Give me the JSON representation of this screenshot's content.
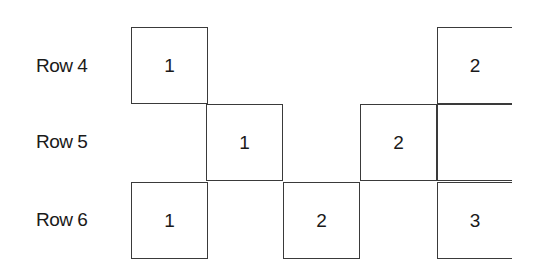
{
  "diagram": {
    "rows": [
      {
        "label": "Row 4",
        "top": 27,
        "label_top": 55
      },
      {
        "label": "Row 5",
        "top": 104,
        "label_top": 131
      },
      {
        "label": "Row 6",
        "top": 182,
        "label_top": 209
      }
    ],
    "columns_x": [
      131,
      206,
      283,
      360,
      437
    ],
    "cell_size": 77,
    "cells": [
      {
        "row": 0,
        "col": 0,
        "value": "1",
        "open_right": false
      },
      {
        "row": 0,
        "col": 4,
        "value": "2",
        "open_right": true
      },
      {
        "row": 1,
        "col": 1,
        "value": "1",
        "open_right": false
      },
      {
        "row": 1,
        "col": 3,
        "value": "2",
        "open_right": false
      },
      {
        "row": 1,
        "col": 4,
        "value": "",
        "open_right": true
      },
      {
        "row": 2,
        "col": 0,
        "value": "1",
        "open_right": false
      },
      {
        "row": 2,
        "col": 2,
        "value": "2",
        "open_right": false
      },
      {
        "row": 2,
        "col": 4,
        "value": "3",
        "open_right": true
      }
    ],
    "line_color": "#3a3a3a"
  }
}
